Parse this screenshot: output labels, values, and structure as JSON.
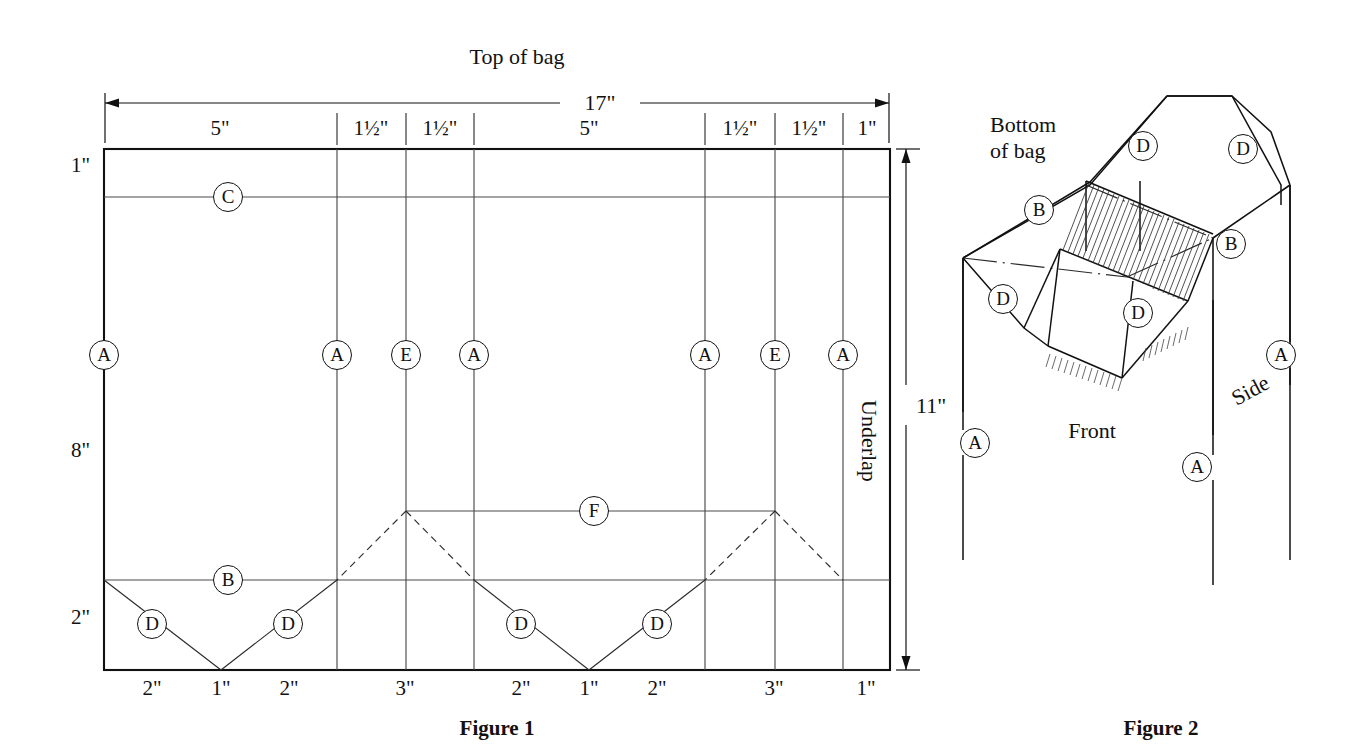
{
  "figure1": {
    "title_top": "Top of bag",
    "caption": "Figure 1",
    "overall_width_label": "17\"",
    "overall_height_label": "11\"",
    "underlap_label": "Underlap",
    "top_segments": [
      {
        "label": "5\"",
        "whole": "5",
        "num": "",
        "den": ""
      },
      {
        "label": "1½\"",
        "whole": "1",
        "num": "1",
        "den": "2"
      },
      {
        "label": "1½\"",
        "whole": "1",
        "num": "1",
        "den": "2"
      },
      {
        "label": "5\"",
        "whole": "5",
        "num": "",
        "den": ""
      },
      {
        "label": "1½\"",
        "whole": "1",
        "num": "1",
        "den": "2"
      },
      {
        "label": "1½\"",
        "whole": "1",
        "num": "1",
        "den": "2"
      },
      {
        "label": "1\"",
        "whole": "1",
        "num": "",
        "den": ""
      }
    ],
    "bottom_segments": [
      "2\"",
      "1\"",
      "2\"",
      "3\"",
      "2\"",
      "1\"",
      "2\"",
      "3\"",
      "1\""
    ],
    "left_segments": [
      "1\"",
      "8\"",
      "2\""
    ],
    "markers": [
      {
        "letter": "C",
        "x": 228,
        "y": 197
      },
      {
        "letter": "A",
        "x": 104,
        "y": 355
      },
      {
        "letter": "A",
        "x": 337,
        "y": 355
      },
      {
        "letter": "E",
        "x": 406,
        "y": 355
      },
      {
        "letter": "A",
        "x": 474,
        "y": 355
      },
      {
        "letter": "A",
        "x": 705,
        "y": 355
      },
      {
        "letter": "E",
        "x": 775,
        "y": 355
      },
      {
        "letter": "A",
        "x": 843,
        "y": 355
      },
      {
        "letter": "F",
        "x": 594,
        "y": 511
      },
      {
        "letter": "B",
        "x": 228,
        "y": 580
      },
      {
        "letter": "D",
        "x": 152,
        "y": 624
      },
      {
        "letter": "D",
        "x": 288,
        "y": 624
      },
      {
        "letter": "D",
        "x": 521,
        "y": 624
      },
      {
        "letter": "D",
        "x": 657,
        "y": 624
      }
    ]
  },
  "figure2": {
    "caption": "Figure 2",
    "bottom_of_bag_line1": "Bottom",
    "bottom_of_bag_line2": "of bag",
    "front_label": "Front",
    "side_label": "Side",
    "markers": [
      {
        "letter": "D",
        "x": 1143,
        "y": 146
      },
      {
        "letter": "D",
        "x": 1243,
        "y": 149
      },
      {
        "letter": "B",
        "x": 1039,
        "y": 210
      },
      {
        "letter": "B",
        "x": 1231,
        "y": 244
      },
      {
        "letter": "D",
        "x": 1003,
        "y": 299
      },
      {
        "letter": "D",
        "x": 1138,
        "y": 313
      },
      {
        "letter": "A",
        "x": 1281,
        "y": 355
      },
      {
        "letter": "A",
        "x": 975,
        "y": 443
      },
      {
        "letter": "A",
        "x": 1197,
        "y": 467
      }
    ]
  },
  "colors": {
    "ink": "#111111",
    "paper": "#ffffff"
  }
}
